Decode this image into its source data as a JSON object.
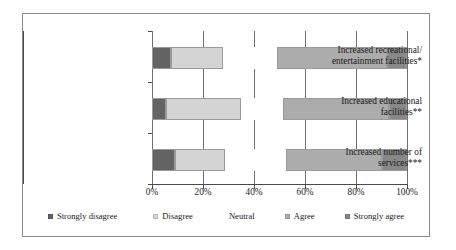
{
  "chart_data": {
    "type": "bar",
    "orientation": "horizontal",
    "stacked": true,
    "stacked_percent": true,
    "title": "",
    "xlabel": "",
    "ylabel": "",
    "xlim": [
      0,
      100
    ],
    "xticks": [
      "0%",
      "20%",
      "40%",
      "60%",
      "80%",
      "100%"
    ],
    "xtick_values": [
      0,
      20,
      40,
      60,
      80,
      100
    ],
    "grid": true,
    "grid_axis": "x",
    "legend_position": "bottom",
    "categories": [
      "Increased recreational/ entertainment facilities*",
      "Increased educational facilities**",
      "Increased number of services***"
    ],
    "category_lines": [
      [
        "Increased recreational/",
        "entertainment facilities*"
      ],
      [
        "Increased educational",
        "facilities**"
      ],
      [
        "Increased number of",
        "services***"
      ]
    ],
    "series": [
      {
        "name": "Strongly disagree",
        "color": "#636363",
        "values": [
          7.5,
          5.5,
          9.0
        ]
      },
      {
        "name": "Disagree",
        "color": "#d4d4d4",
        "values": [
          20.5,
          29.5,
          19.5
        ]
      },
      {
        "name": "Neutral",
        "color": "#ffffff",
        "values": [
          21.0,
          16.5,
          24.0
        ]
      },
      {
        "name": "Agree",
        "color": "#acacac",
        "values": [
          43.0,
          41.5,
          37.5
        ]
      },
      {
        "name": "Strongly agree",
        "color": "#888888",
        "values": [
          8.0,
          7.0,
          10.0
        ]
      }
    ],
    "legend_entries": [
      {
        "label": "Strongly disagree",
        "color": "#636363"
      },
      {
        "label": "Disagree",
        "color": "#d4d4d4"
      },
      {
        "label": "Neutral",
        "color": "#ffffff"
      },
      {
        "label": "Agree",
        "color": "#acacac"
      },
      {
        "label": "Strongly agree",
        "color": "#888888"
      }
    ]
  }
}
